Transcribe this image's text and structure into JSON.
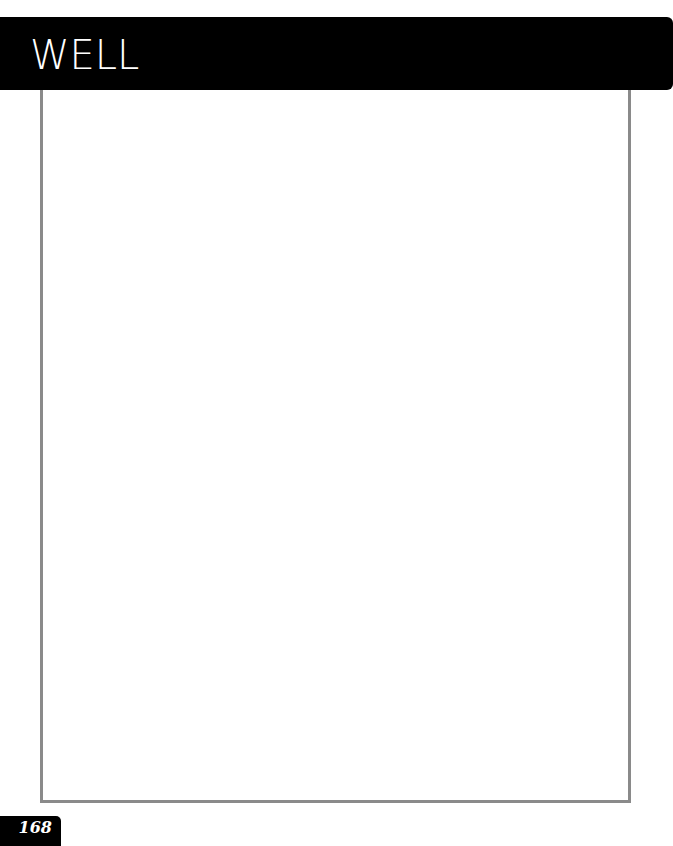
{
  "header": {
    "title": "WELL"
  },
  "content": {
    "frame_label": ""
  },
  "footer": {
    "page_number": "168"
  },
  "colors": {
    "header_background": "#000000",
    "header_text": "#ffffff",
    "frame_border": "#8a8a8a",
    "page_badge_background": "#000000"
  }
}
